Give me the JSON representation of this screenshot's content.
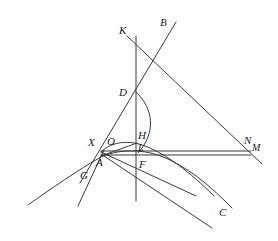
{
  "figure": {
    "kind": "geometry-diagram",
    "width": 278,
    "height": 241,
    "background_color": "#ffffff",
    "stroke_color": "#3a3a3a",
    "label_color": "#1a1a1a"
  },
  "labels": {
    "K": "K",
    "B": "B",
    "D": "D",
    "X": "X",
    "O": "O",
    "H": "H",
    "L": "L",
    "A": "A",
    "F": "F",
    "G": "G",
    "N": "N",
    "M": "M",
    "C": "C"
  },
  "points": [
    {
      "name": "K",
      "label": "K",
      "x": 124,
      "y": 30,
      "lx": 119,
      "ly": 25
    },
    {
      "name": "B",
      "label": "B",
      "x": 176,
      "y": 22,
      "lx": 160,
      "ly": 17
    },
    {
      "name": "D",
      "label": "D",
      "x": 136,
      "y": 92,
      "lx": 119,
      "ly": 87
    },
    {
      "name": "X",
      "label": "X",
      "x": 101,
      "y": 151,
      "lx": 88,
      "ly": 137
    },
    {
      "name": "O",
      "label": "O",
      "x": 112,
      "y": 150,
      "lx": 107,
      "ly": 136
    },
    {
      "name": "H",
      "label": "H",
      "x": 136,
      "y": 142,
      "lx": 138,
      "ly": 130
    },
    {
      "name": "L",
      "label": "L",
      "x": 136,
      "y": 151,
      "lx": 138,
      "ly": 143
    },
    {
      "name": "A",
      "label": "A",
      "x": 103,
      "y": 158,
      "lx": 96,
      "ly": 157
    },
    {
      "name": "F",
      "label": "F",
      "x": 136,
      "y": 160,
      "lx": 139,
      "ly": 159
    },
    {
      "name": "G",
      "label": "G",
      "x": 86,
      "y": 168,
      "lx": 80,
      "ly": 170
    },
    {
      "name": "N",
      "label": "N",
      "x": 248,
      "y": 146,
      "lx": 244,
      "ly": 137
    },
    {
      "name": "M",
      "label": "M",
      "x": 253,
      "y": 152,
      "lx": 252,
      "ly": 143
    },
    {
      "name": "C",
      "label": "C",
      "x": 222,
      "y": 212,
      "lx": 219,
      "ly": 207
    }
  ],
  "segments": [
    {
      "name": "vertical-axis-K-to-bottom",
      "x1": 136,
      "y1": 36,
      "x2": 136,
      "y2": 201
    },
    {
      "name": "line-B-through-D-to-G",
      "x1": 176,
      "y1": 22,
      "x2": 80,
      "y2": 183
    },
    {
      "name": "line-K-to-M",
      "x1": 127,
      "y1": 36,
      "x2": 262,
      "y2": 164
    },
    {
      "name": "horizontal-upper-X-to-N",
      "x1": 101,
      "y1": 151,
      "x2": 251,
      "y2": 151
    },
    {
      "name": "horizontal-lower-X-to-M",
      "x1": 101,
      "y1": 155,
      "x2": 251,
      "y2": 155
    },
    {
      "name": "line-A-to-lower-right",
      "x1": 101,
      "y1": 154,
      "x2": 212,
      "y2": 228
    },
    {
      "name": "line-X-to-lower-right-2",
      "x1": 101,
      "y1": 152,
      "x2": 196,
      "y2": 196
    },
    {
      "name": "line-G-descending",
      "x1": 104,
      "y1": 150,
      "x2": 78,
      "y2": 206
    },
    {
      "name": "chord-A-to-H",
      "x1": 101,
      "y1": 156,
      "x2": 137,
      "y2": 143
    }
  ],
  "curves": [
    {
      "name": "arc-from-D-angle-marker",
      "d": "M 136 92 C 153 108 157 132 138 153"
    },
    {
      "name": "conic-upper-through-X-H",
      "d": "M 101 152 C 112 141 130 140 145 146 C 166 154 190 172 214 196"
    },
    {
      "name": "conic-lower-through-A",
      "d": "M 28 205 C 52 188 78 170 101 157 C 124 147 150 150 170 160 C 196 173 214 190 232 208"
    }
  ]
}
